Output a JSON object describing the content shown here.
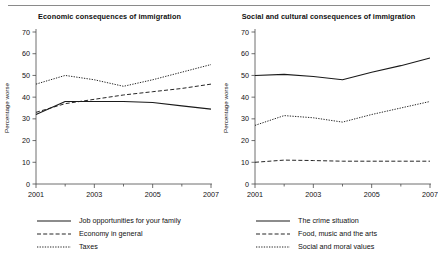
{
  "figure": {
    "panel_count": 2,
    "background_color": "#ffffff",
    "line_color": "#1a1a1a"
  },
  "chart_data": [
    {
      "type": "line",
      "title": "Economic consequences of immigration",
      "xlabel": "",
      "ylabel": "Percentage worse",
      "x": [
        2001,
        2002,
        2003,
        2004,
        2005,
        2006,
        2007
      ],
      "tick_labels_x": [
        "2001",
        "2003",
        "2005",
        "2007"
      ],
      "tick_values_x": [
        2001,
        2003,
        2005,
        2007
      ],
      "tick_labels_y": [
        "0",
        "10",
        "20",
        "30",
        "40",
        "50",
        "60",
        "70"
      ],
      "tick_values_y": [
        0,
        10,
        20,
        30,
        40,
        50,
        60,
        70
      ],
      "ylim": [
        0,
        70
      ],
      "xlim": [
        2001,
        2007
      ],
      "grid": false,
      "legend_position": "below",
      "series": [
        {
          "name": "Job opportunities for your family",
          "dash": "solid",
          "values": [
            32,
            38,
            38,
            38,
            37.5,
            36,
            34.5
          ]
        },
        {
          "name": "Economy in general",
          "dash": "dashed",
          "values": [
            33,
            37,
            39,
            41,
            42.5,
            44,
            46
          ]
        },
        {
          "name": "Taxes",
          "dash": "dotted",
          "values": [
            46,
            50,
            48,
            45,
            48,
            51.5,
            55
          ]
        }
      ]
    },
    {
      "type": "line",
      "title": "Social and cultural consequences of immigration",
      "xlabel": "",
      "ylabel": "Percentage worse",
      "x": [
        2001,
        2002,
        2003,
        2004,
        2005,
        2006,
        2007
      ],
      "tick_labels_x": [
        "2001",
        "2003",
        "2005",
        "2007"
      ],
      "tick_values_x": [
        2001,
        2003,
        2005,
        2007
      ],
      "tick_labels_y": [
        "0",
        "10",
        "20",
        "30",
        "40",
        "50",
        "60",
        "70"
      ],
      "tick_values_y": [
        0,
        10,
        20,
        30,
        40,
        50,
        60,
        70
      ],
      "ylim": [
        0,
        70
      ],
      "xlim": [
        2001,
        2007
      ],
      "grid": false,
      "legend_position": "below",
      "series": [
        {
          "name": "The crime situation",
          "dash": "solid",
          "values": [
            50,
            50.5,
            49.5,
            48,
            51.5,
            54.5,
            58
          ]
        },
        {
          "name": "Food, music and the arts",
          "dash": "dashed",
          "values": [
            10,
            11,
            10.8,
            10.5,
            10.5,
            10.5,
            10.5
          ]
        },
        {
          "name": "Social and moral values",
          "dash": "dotted",
          "values": [
            27,
            31.5,
            30.5,
            28.5,
            32,
            35,
            38
          ]
        }
      ]
    }
  ]
}
